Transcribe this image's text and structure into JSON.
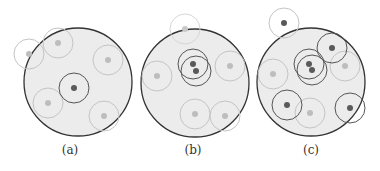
{
  "colors": {
    "disk_fill": "#ececec",
    "disk_stroke": "#333333",
    "dark_ring": "#555555",
    "light_ring": "#c4c4c4",
    "dark_dot": "#5a5a5a",
    "light_dot": "#bdbdbd"
  },
  "panels": [
    {
      "label": "(a)",
      "label_x": 70,
      "disk": {
        "cx": 78,
        "cy": 82,
        "r": 54
      },
      "nodes": [
        {
          "cx": 29,
          "cy": 54,
          "r": 15,
          "type": "light"
        },
        {
          "cx": 58,
          "cy": 43,
          "r": 15,
          "type": "light"
        },
        {
          "cx": 108,
          "cy": 60,
          "r": 15,
          "type": "light"
        },
        {
          "cx": 74,
          "cy": 88,
          "r": 15,
          "type": "dark"
        },
        {
          "cx": 48,
          "cy": 103,
          "r": 15,
          "type": "light"
        },
        {
          "cx": 104,
          "cy": 116,
          "r": 15,
          "type": "light"
        }
      ]
    },
    {
      "label": "(b)",
      "label_x": 193,
      "disk": {
        "cx": 195,
        "cy": 83,
        "r": 54
      },
      "nodes": [
        {
          "cx": 185,
          "cy": 29,
          "r": 15,
          "type": "faint"
        },
        {
          "cx": 193,
          "cy": 64,
          "r": 15,
          "type": "dark"
        },
        {
          "cx": 196,
          "cy": 71,
          "r": 15,
          "type": "dark"
        },
        {
          "cx": 157,
          "cy": 76,
          "r": 15,
          "type": "light"
        },
        {
          "cx": 230,
          "cy": 66,
          "r": 15,
          "type": "light"
        },
        {
          "cx": 195,
          "cy": 114,
          "r": 15,
          "type": "light"
        },
        {
          "cx": 225,
          "cy": 116,
          "r": 15,
          "type": "light"
        }
      ]
    },
    {
      "label": "(c)",
      "label_x": 311,
      "disk": {
        "cx": 311,
        "cy": 82,
        "r": 54
      },
      "nodes": [
        {
          "cx": 284,
          "cy": 23,
          "r": 15,
          "type": "dark-faintring"
        },
        {
          "cx": 332,
          "cy": 48,
          "r": 15,
          "type": "dark"
        },
        {
          "cx": 309,
          "cy": 64,
          "r": 15,
          "type": "dark"
        },
        {
          "cx": 312,
          "cy": 70,
          "r": 15,
          "type": "dark"
        },
        {
          "cx": 345,
          "cy": 66,
          "r": 15,
          "type": "light"
        },
        {
          "cx": 273,
          "cy": 74,
          "r": 15,
          "type": "light"
        },
        {
          "cx": 287,
          "cy": 105,
          "r": 15,
          "type": "dark"
        },
        {
          "cx": 310,
          "cy": 113,
          "r": 15,
          "type": "light"
        },
        {
          "cx": 350,
          "cy": 108,
          "r": 15,
          "type": "dark"
        }
      ]
    }
  ]
}
